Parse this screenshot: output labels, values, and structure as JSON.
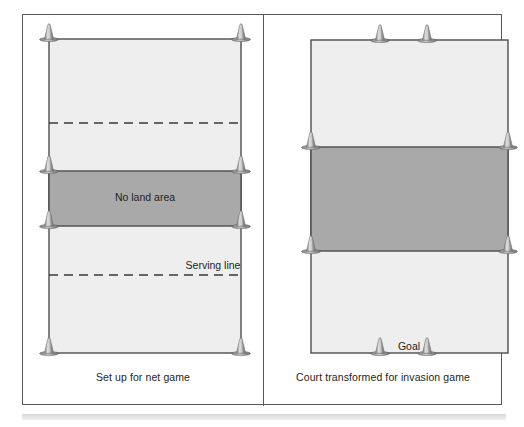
{
  "figure": {
    "type": "sports-court-diagram",
    "panels": [
      {
        "id": "net-game",
        "caption": "Set up for net game",
        "court": {
          "x": 26,
          "y": 24,
          "width": 192,
          "height": 314,
          "fill": "#eeeeee",
          "stroke": "#4d4d4f"
        },
        "bands": [
          {
            "name": "no-land-area",
            "label": "No land area",
            "label_x": 122,
            "label_y": 183,
            "y": 156,
            "height": 55,
            "fill": "#a9a9a9"
          }
        ],
        "dashed_lines": [
          {
            "name": "halfway-dashed-line",
            "y": 108,
            "label": ""
          },
          {
            "name": "serving-line",
            "y": 260,
            "label": "Serving line",
            "label_x": 190,
            "label_y": 251
          }
        ],
        "cones": [
          {
            "name": "cone-top-left",
            "x": 26,
            "y": 24
          },
          {
            "name": "cone-top-right",
            "x": 218,
            "y": 24
          },
          {
            "name": "cone-mid-upper-left",
            "x": 26,
            "y": 156
          },
          {
            "name": "cone-mid-upper-right",
            "x": 218,
            "y": 156
          },
          {
            "name": "cone-mid-lower-left",
            "x": 26,
            "y": 211
          },
          {
            "name": "cone-mid-lower-right",
            "x": 218,
            "y": 211
          },
          {
            "name": "cone-bottom-left",
            "x": 26,
            "y": 338
          },
          {
            "name": "cone-bottom-right",
            "x": 218,
            "y": 338
          }
        ]
      },
      {
        "id": "invasion-game",
        "caption": "Court transformed for invasion game",
        "court": {
          "x": 48,
          "y": 25,
          "width": 197,
          "height": 313,
          "fill": "#eeeeee",
          "stroke": "#4d4d4f"
        },
        "bands": [
          {
            "name": "central-zone",
            "label": "",
            "label_x": 0,
            "label_y": 0,
            "y": 132,
            "height": 104,
            "fill": "#a9a9a9"
          }
        ],
        "dashed_lines": [],
        "goal_label": "Goal",
        "goal_label_x": 146,
        "goal_label_y": 331,
        "cones": [
          {
            "name": "cone-goal-top-left",
            "x": 117,
            "y": 25
          },
          {
            "name": "cone-goal-top-right",
            "x": 164,
            "y": 25
          },
          {
            "name": "cone-zone-upper-left",
            "x": 48,
            "y": 132
          },
          {
            "name": "cone-zone-upper-right",
            "x": 245,
            "y": 132
          },
          {
            "name": "cone-zone-lower-left",
            "x": 48,
            "y": 236
          },
          {
            "name": "cone-zone-lower-right",
            "x": 245,
            "y": 236
          },
          {
            "name": "cone-goal-bottom-left",
            "x": 117,
            "y": 338
          },
          {
            "name": "cone-goal-bottom-right",
            "x": 164,
            "y": 338
          }
        ]
      }
    ],
    "colors": {
      "frame_stroke": "#58585a",
      "court_fill": "#eeeeee",
      "court_stroke": "#4d4d4f",
      "band_fill": "#a9a9a9",
      "text": "#231f20",
      "cone_body": "#9a9a9a",
      "cone_highlight": "#d5d5d5",
      "cone_base": "#6f6f6f"
    }
  }
}
